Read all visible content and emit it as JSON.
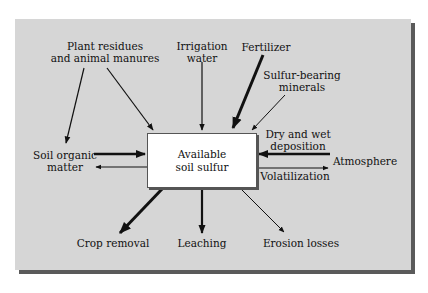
{
  "diagram": {
    "center": "Available\nsoil sulfur",
    "sources": {
      "plant_residues": "Plant residues\nand animal manures",
      "irrigation": "Irrigation\nwater",
      "fertilizer": "Fertilizer",
      "minerals": "Sulfur-bearing\nminerals",
      "deposition": "Dry and wet\ndeposition",
      "atmosphere": "Atmosphere"
    },
    "exchanges": {
      "soil_organic": "Soil organic\nmatter",
      "volatilization": "Volatilization"
    },
    "losses": {
      "crop_removal": "Crop removal",
      "leaching": "Leaching",
      "erosion": "Erosion losses"
    },
    "colors": {
      "panel": "#d6d6d6",
      "shadow": "#5a5a5a",
      "box": "#ffffff",
      "arrow": "#111111"
    }
  }
}
